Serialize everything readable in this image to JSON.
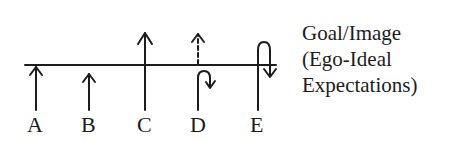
{
  "diagram": {
    "baseline_label": "Goal/Image",
    "legend_lines": [
      "Goal/Image",
      "(Ego-Ideal",
      "Expectations)"
    ],
    "arrows": [
      {
        "id": "A",
        "label": "A",
        "description": "arrow rising to reach the goal line"
      },
      {
        "id": "B",
        "label": "B",
        "description": "arrow falling short of the goal line"
      },
      {
        "id": "C",
        "label": "C",
        "description": "arrow passing well above the goal line"
      },
      {
        "id": "D",
        "label": "D",
        "description": "arrow turning back just below the line; dashed continuation above"
      },
      {
        "id": "E",
        "label": "E",
        "description": "arrow crossing the line then looping back down below it"
      }
    ],
    "colors": {
      "ink": "#1c1c1c",
      "background": "#ffffff"
    }
  }
}
